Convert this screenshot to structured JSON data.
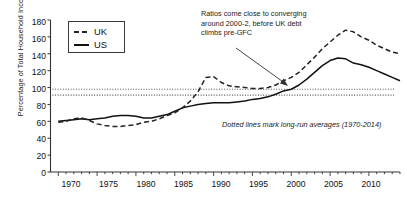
{
  "chart_data": {
    "type": "line",
    "title": "",
    "xlabel": "",
    "ylabel": "Percentage of Total Household Income",
    "xlim": [
      1969,
      2014
    ],
    "ylim": [
      0,
      180
    ],
    "ytick_step": 20,
    "yticks": [
      0,
      20,
      40,
      60,
      80,
      100,
      120,
      140,
      160,
      180
    ],
    "xticks": [
      1970,
      1975,
      1980,
      1985,
      1990,
      1995,
      2000,
      2005,
      2010
    ],
    "grid": false,
    "legend_position": "top-left",
    "legend": [
      "UK",
      "US"
    ],
    "x": [
      1970,
      1971,
      1972,
      1973,
      1974,
      1975,
      1976,
      1977,
      1978,
      1979,
      1980,
      1981,
      1982,
      1983,
      1984,
      1985,
      1986,
      1987,
      1988,
      1989,
      1990,
      1991,
      1992,
      1993,
      1994,
      1995,
      1996,
      1997,
      1998,
      1999,
      2000,
      2001,
      2002,
      2003,
      2004,
      2005,
      2006,
      2007,
      2008,
      2009,
      2010,
      2011,
      2012,
      2013,
      2014
    ],
    "series": [
      {
        "name": "UK",
        "style": "dashed",
        "values": [
          59,
          60,
          63,
          64,
          61,
          57,
          55,
          54,
          54,
          55,
          56,
          59,
          60,
          63,
          67,
          70,
          76,
          84,
          95,
          112,
          113,
          106,
          102,
          101,
          100,
          99,
          99,
          100,
          103,
          108,
          112,
          118,
          127,
          136,
          146,
          154,
          162,
          168,
          166,
          160,
          156,
          150,
          146,
          142,
          140
        ]
      },
      {
        "name": "US",
        "style": "solid",
        "values": [
          60,
          61,
          62,
          63,
          62,
          63,
          64,
          66,
          67,
          67,
          66,
          64,
          64,
          66,
          68,
          72,
          76,
          78,
          80,
          81,
          82,
          82,
          82,
          83,
          84,
          86,
          87,
          89,
          92,
          96,
          98,
          103,
          110,
          118,
          126,
          132,
          135,
          134,
          129,
          127,
          124,
          120,
          116,
          112,
          108
        ]
      }
    ],
    "reference_lines": [
      {
        "label": "UK long-run average",
        "value": 98,
        "style": "dotted"
      },
      {
        "label": "US long-run average",
        "value": 91,
        "style": "dotted"
      }
    ],
    "annotations": [
      {
        "name": "convergence-note",
        "text": "Ratios come close to converging around 2000-2, before UK debt climbs pre-GFC",
        "arrow_to_x": 2000,
        "arrow_to_y": 100
      },
      {
        "name": "dotted-line-note",
        "text": "Dotted lines mark long-run averages (1970-2014)"
      }
    ],
    "colors": {
      "uk": "#222222",
      "us": "#111111",
      "axis": "#333333",
      "dotted": "#555555"
    }
  }
}
